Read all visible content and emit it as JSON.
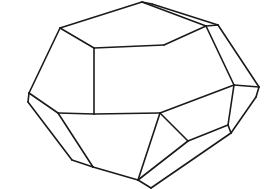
{
  "figure": {
    "title": "",
    "stroke_color": "#1a1a1a",
    "background": "#ffffff"
  },
  "vertices": {
    "A": [
      60,
      28
    ],
    "B": [
      142,
      2
    ],
    "B2": [
      152,
      4
    ],
    "C": [
      94,
      48
    ],
    "D": [
      164,
      45
    ],
    "E": [
      206,
      26
    ],
    "E2": [
      218,
      25
    ],
    "F": [
      29,
      93
    ],
    "F2": [
      28,
      102
    ],
    "G": [
      94,
      114
    ],
    "H": [
      160,
      113
    ],
    "I": [
      234,
      85
    ],
    "J": [
      259,
      87
    ],
    "J2": [
      256,
      97
    ],
    "K": [
      58,
      113
    ],
    "L": [
      72,
      160
    ],
    "M": [
      93,
      167
    ],
    "N": [
      188,
      141
    ],
    "O": [
      228,
      125
    ],
    "O2": [
      231,
      133
    ],
    "P": [
      182,
      162
    ],
    "Q": [
      232,
      177
    ],
    "R": [
      138,
      180
    ],
    "S": [
      151,
      188
    ]
  },
  "edges": [
    [
      "A",
      "B"
    ],
    [
      "A",
      "C"
    ],
    [
      "C",
      "D"
    ],
    [
      "C",
      "G"
    ],
    [
      "A",
      "F"
    ],
    [
      "B",
      "E"
    ],
    [
      "B2",
      "E2"
    ],
    [
      "B",
      "B2"
    ],
    [
      "D",
      "E"
    ],
    [
      "E",
      "E2"
    ],
    [
      "E",
      "I"
    ],
    [
      "E2",
      "J"
    ],
    [
      "I",
      "J"
    ],
    [
      "I",
      "O"
    ],
    [
      "J",
      "J2"
    ],
    [
      "J2",
      "O2"
    ],
    [
      "O",
      "O2"
    ],
    [
      "F",
      "K"
    ],
    [
      "F",
      "F2"
    ],
    [
      "F2",
      "L"
    ],
    [
      "K",
      "G"
    ],
    [
      "K",
      "M"
    ],
    [
      "L",
      "M"
    ],
    [
      "G",
      "H"
    ],
    [
      "H",
      "N"
    ],
    [
      "H",
      "I"
    ],
    [
      "N",
      "O"
    ],
    [
      "M",
      "R"
    ],
    [
      "H",
      "R"
    ],
    [
      "R",
      "S"
    ],
    [
      "N",
      "R"
    ],
    [
      "O2",
      "S"
    ]
  ]
}
